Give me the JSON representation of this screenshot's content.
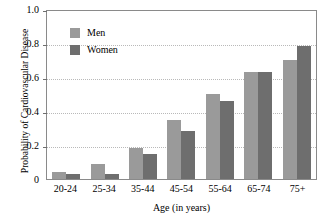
{
  "chart_data": {
    "type": "bar",
    "title": "",
    "xlabel": "Age (in years)",
    "ylabel": "Probability of Cardiovascular Disease",
    "categories": [
      "20-24",
      "25-34",
      "35-44",
      "45-54",
      "55-64",
      "65-74",
      "75+"
    ],
    "series": [
      {
        "name": "Men",
        "color": "#9a9a9a",
        "values": [
          0.04,
          0.09,
          0.18,
          0.35,
          0.5,
          0.63,
          0.7
        ]
      },
      {
        "name": "Women",
        "color": "#6e6e6e",
        "values": [
          0.03,
          0.03,
          0.145,
          0.285,
          0.46,
          0.63,
          0.78
        ]
      }
    ],
    "ylim": [
      0,
      1.0
    ],
    "yticks": [
      "0",
      "0.2",
      "0.4",
      "0.6",
      "0.8",
      "1.0"
    ],
    "ytick_values": [
      0,
      0.2,
      0.4,
      0.6,
      0.8,
      1.0
    ],
    "grid": "horizontal-dotted",
    "legend_position": "upper-left-inside"
  }
}
